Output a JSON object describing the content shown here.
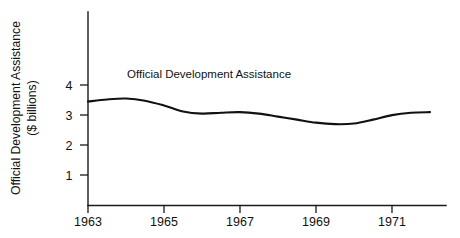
{
  "chart_data": {
    "type": "line",
    "title": "",
    "subtitle": "",
    "xlabel": "",
    "ylabel": "Official Development Assistance\n($ billions)",
    "ylabel_line1": "Official Development Assistance",
    "ylabel_line2": "($ billions)",
    "annotations": [
      {
        "text": "Official Development Assistance",
        "x": 1963.9,
        "y": 4.1
      }
    ],
    "legend": {
      "position": "inline-annotation",
      "entries": [
        "Official Development Assistance"
      ]
    },
    "grid": false,
    "xlim": [
      1962.6,
      1972.4
    ],
    "ylim": [
      0,
      4.8
    ],
    "xticks": [
      1963,
      1965,
      1967,
      1969,
      1971
    ],
    "xtick_labels": [
      "1963",
      "1965",
      "1967",
      "1969",
      "1971"
    ],
    "yticks": [
      1,
      2,
      3,
      4
    ],
    "ytick_labels": [
      "1",
      "2",
      "3",
      "4"
    ],
    "series": [
      {
        "name": "Official Development Assistance",
        "color": "#111111",
        "x": [
          1963.0,
          1963.5,
          1964.0,
          1964.5,
          1965.0,
          1965.5,
          1966.0,
          1966.5,
          1967.0,
          1967.5,
          1968.0,
          1968.5,
          1969.0,
          1969.5,
          1970.0,
          1970.5,
          1971.0,
          1971.5,
          1972.0
        ],
        "values": [
          3.45,
          3.52,
          3.55,
          3.48,
          3.32,
          3.12,
          3.05,
          3.08,
          3.1,
          3.05,
          2.95,
          2.85,
          2.75,
          2.7,
          2.72,
          2.85,
          3.0,
          3.08,
          3.1
        ]
      }
    ]
  },
  "axes": {
    "ytick_values": [
      "4",
      "3",
      "2",
      "1"
    ],
    "xtick_values": [
      "1963",
      "1965",
      "1967",
      "1969",
      "1971"
    ]
  },
  "labels": {
    "y_axis_line1": "Official Development Assistance",
    "y_axis_line2": "($ billions)",
    "series_note": "Official Development Assistance"
  },
  "colors": {
    "line": "#111111",
    "axis": "#1a1a1a",
    "background": "#ffffff"
  }
}
